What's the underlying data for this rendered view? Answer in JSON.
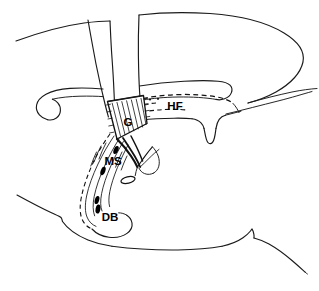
{
  "figure": {
    "background_color": "#ffffff",
    "ink_color": "#111111"
  },
  "labels": [
    {
      "id": "G",
      "text": "G",
      "full_name": "septal graft region",
      "x": 128,
      "y": 122,
      "font_size": 11.5,
      "color": "#000000"
    },
    {
      "id": "HF",
      "text": "HF",
      "full_name": "hippocampal formation",
      "x": 175,
      "y": 106,
      "font_size": 11.5,
      "color": "#000000"
    },
    {
      "id": "MS",
      "text": "MS",
      "full_name": "medial septum",
      "x": 113,
      "y": 161,
      "font_size": 11.5,
      "color": "#000000"
    },
    {
      "id": "DB",
      "text": "DB",
      "full_name": "diagonal band",
      "x": 110,
      "y": 217,
      "font_size": 11.5,
      "color": "#000000"
    }
  ],
  "regions": [
    {
      "id": "graft",
      "label": "G",
      "style": "hatched quadrilateral",
      "stroke": "#111111"
    },
    {
      "id": "hippocampal-formation",
      "label": "HF",
      "style": "dashed outline",
      "stroke": "#111111"
    },
    {
      "id": "medial-septum",
      "label": "MS",
      "style": "fiber bundle with cell bodies",
      "stroke": "#111111"
    },
    {
      "id": "diagonal-band",
      "label": "DB",
      "style": "fiber bundle with cell bodies",
      "stroke": "#111111"
    }
  ],
  "cell_markers": {
    "count": 4,
    "color": "#000000",
    "shape": "elongated-teardrop"
  }
}
